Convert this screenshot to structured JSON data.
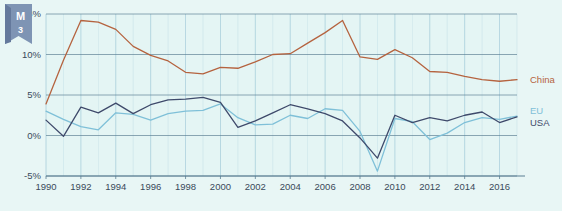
{
  "badge": {
    "letter": "M",
    "number": "3"
  },
  "colors": {
    "background": "#e8f6f5",
    "plot_bg": "#e4f5f4",
    "grid": "#9fc9d8",
    "axis": "#5b7f93",
    "china": "#b5633f",
    "eu": "#7fc0d8",
    "usa": "#3f4a6b",
    "text": "#3a4a5a"
  },
  "legend": {
    "position": "right",
    "entries": [
      {
        "label": "China",
        "color": "#b5633f"
      },
      {
        "label": "EU",
        "color": "#7fc0d8"
      },
      {
        "label": "USA",
        "color": "#3f4a6b"
      }
    ]
  },
  "chart_data": {
    "type": "line",
    "title": "",
    "subtitle": "",
    "xlabel": "",
    "ylabel": "",
    "xlim": [
      1990,
      2017
    ],
    "ylim": [
      -5,
      15
    ],
    "grid": true,
    "y_ticks": [
      -5,
      0,
      5,
      10,
      15
    ],
    "y_tick_labels": [
      "-5%",
      "0%",
      "5%",
      "10%",
      "15%"
    ],
    "x_ticks": [
      1990,
      1992,
      1994,
      1996,
      1998,
      2000,
      2002,
      2004,
      2006,
      2008,
      2010,
      2012,
      2014,
      2016
    ],
    "x_tick_labels": [
      "1990",
      "1992",
      "1994",
      "1996",
      "1998",
      "2000",
      "2002",
      "2004",
      "2006",
      "2008",
      "2010",
      "2012",
      "2014",
      "2016"
    ],
    "x": [
      1990,
      1991,
      1992,
      1993,
      1994,
      1995,
      1996,
      1997,
      1998,
      1999,
      2000,
      2001,
      2002,
      2003,
      2004,
      2005,
      2006,
      2007,
      2008,
      2009,
      2010,
      2011,
      2012,
      2013,
      2014,
      2015,
      2016,
      2017
    ],
    "series": [
      {
        "name": "China",
        "color": "#b5633f",
        "values": [
          3.9,
          9.3,
          14.2,
          14.0,
          13.1,
          11.0,
          9.9,
          9.2,
          7.8,
          7.6,
          8.4,
          8.3,
          9.1,
          10.0,
          10.1,
          11.4,
          12.7,
          14.2,
          9.7,
          9.4,
          10.6,
          9.6,
          7.9,
          7.8,
          7.3,
          6.9,
          6.7,
          6.9
        ]
      },
      {
        "name": "EU",
        "color": "#7fc0d8",
        "values": [
          3.0,
          2.0,
          1.1,
          0.7,
          2.8,
          2.6,
          1.9,
          2.7,
          3.0,
          3.1,
          3.9,
          2.2,
          1.3,
          1.4,
          2.5,
          2.1,
          3.3,
          3.1,
          0.5,
          -4.4,
          2.1,
          1.7,
          -0.5,
          0.3,
          1.6,
          2.2,
          2.0,
          2.4
        ]
      },
      {
        "name": "USA",
        "color": "#3f4a6b",
        "values": [
          1.9,
          -0.1,
          3.5,
          2.8,
          4.0,
          2.7,
          3.8,
          4.4,
          4.5,
          4.7,
          4.1,
          1.0,
          1.8,
          2.8,
          3.8,
          3.3,
          2.7,
          1.8,
          -0.3,
          -2.8,
          2.5,
          1.6,
          2.2,
          1.8,
          2.5,
          2.9,
          1.6,
          2.3
        ]
      }
    ]
  }
}
